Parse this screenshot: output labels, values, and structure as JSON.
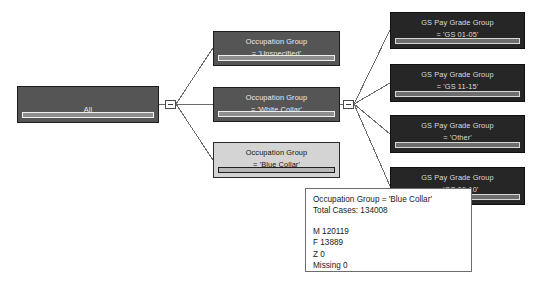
{
  "view": {
    "title": "Decision Tree",
    "background": "#ffffff",
    "node_fill_dark": "#555555",
    "node_fill_darker": "#262626",
    "node_fill_selected": "#d4d4d4",
    "edge_color": "#6a6a6a"
  },
  "root": {
    "label": "All",
    "bar_fill_percent": 100
  },
  "toggles": [
    {
      "name": "collapse-root",
      "glyph": "−",
      "state": "expanded"
    },
    {
      "name": "collapse-white-collar",
      "glyph": "−",
      "state": "expanded"
    }
  ],
  "level1": [
    {
      "line1": "Occupation Group",
      "line2": "= 'Unspecified'",
      "style": "dark",
      "bar_fill_percent": 96,
      "selected": false
    },
    {
      "line1": "Occupation Group",
      "line2": "= 'White Collar'",
      "style": "dark",
      "bar_fill_percent": 96,
      "selected": false
    },
    {
      "line1": "Occupation Group",
      "line2": "= 'Blue Collar'",
      "style": "selected",
      "bar_fill_percent": 96,
      "selected": true
    }
  ],
  "level2": [
    {
      "line1": "GS Pay Grade Group",
      "line2": "= 'GS 01-05'",
      "style": "darker",
      "bar_fill_percent": 96
    },
    {
      "line1": "GS Pay Grade Group",
      "line2": "= 'GS 11-15'",
      "style": "darker",
      "bar_fill_percent": 96
    },
    {
      "line1": "GS Pay Grade Group",
      "line2": "= 'Other'",
      "style": "darker",
      "bar_fill_percent": 96
    },
    {
      "line1": "GS Pay Grade Group",
      "line2": "= 'GS 06-10'",
      "style": "darker",
      "bar_fill_percent": 96
    }
  ],
  "tooltip": {
    "header": "Occupation Group = 'Blue Collar'",
    "total_cases": "Total Cases: 134008",
    "stats": [
      "M  120119",
      "F  13889",
      "Z  0",
      "Missing  0"
    ]
  }
}
